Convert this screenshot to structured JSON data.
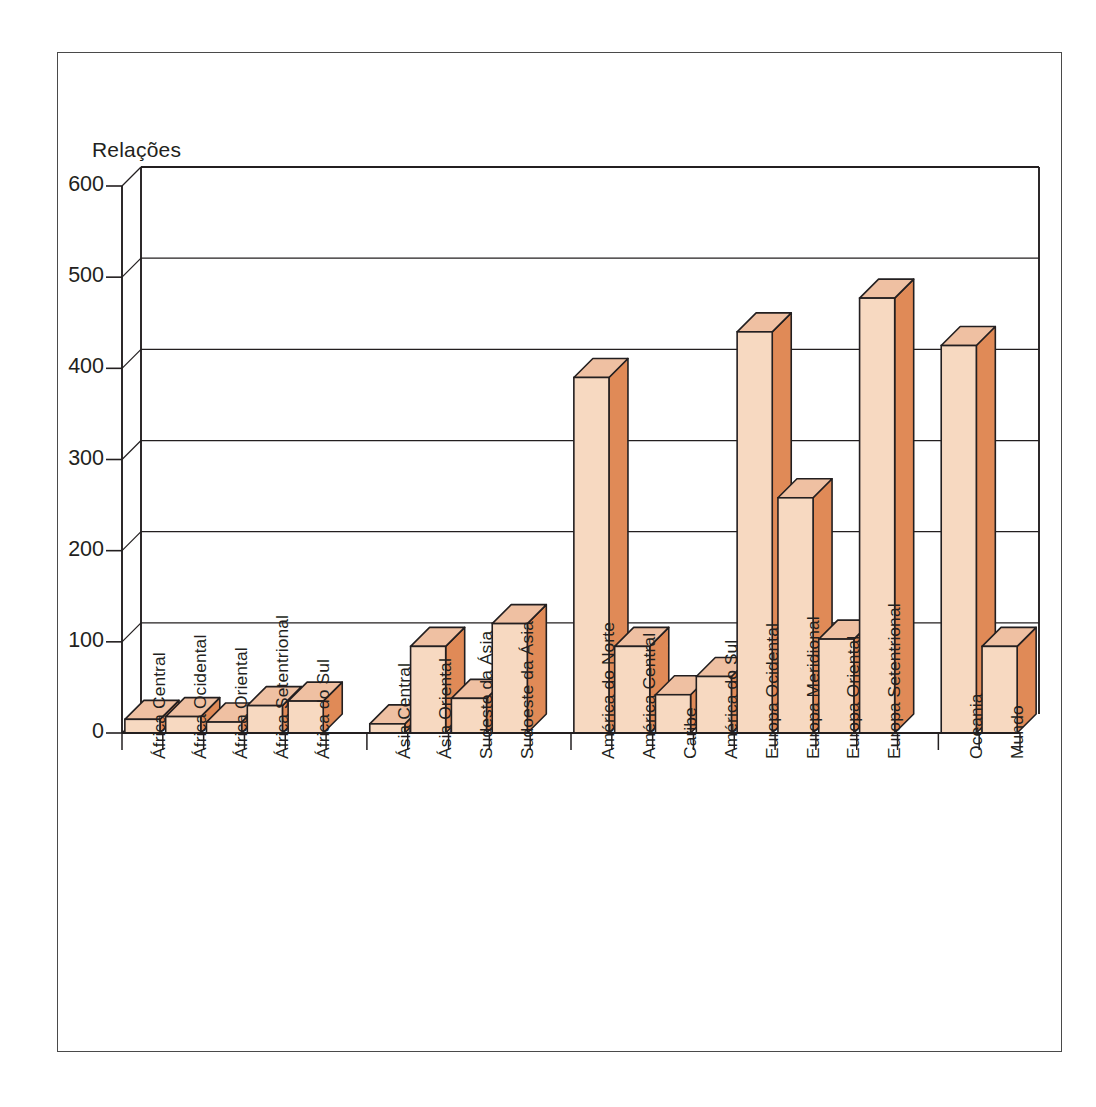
{
  "chart_data": {
    "type": "bar",
    "title": "",
    "subtitle": "",
    "ylabel": "Relações",
    "xlabel": "",
    "ylim": [
      0,
      600
    ],
    "yticks": [
      0,
      100,
      200,
      300,
      400,
      500,
      600
    ],
    "ytick_labels": [
      "0",
      "100",
      "200",
      "300",
      "400",
      "500",
      "600"
    ],
    "grid": true,
    "grid_axis": "y",
    "legend": false,
    "style": "3d-bar",
    "bar_face_color": "#F7D9C1",
    "bar_side_color": "#E08A57",
    "bar_top_color": "#EFC0A2",
    "bar_edge_color": "#231f20",
    "categories": [
      "África Central",
      "África Ocidental",
      "África Oriental",
      "África Setentrional",
      "África do Sul",
      "Ásia Central",
      "Ásia Oriental",
      "Sudeste da Ásia",
      "Sudoeste da Ásia",
      "América do Norte",
      "América Central",
      "Caribe",
      "América do Sul",
      "Europa Ocidental",
      "Europa Meridional",
      "Europa Oriental",
      "Europa Setentrional",
      "Oceania",
      "Mundo"
    ],
    "values": [
      15,
      18,
      12,
      30,
      35,
      10,
      95,
      38,
      120,
      390,
      95,
      42,
      62,
      440,
      258,
      103,
      477,
      425,
      95
    ],
    "group_breaks_after": [
      "África do Sul",
      "Sudoeste da Ásia",
      "América do Sul",
      "Europa Setentrional"
    ],
    "slot_index": [
      0,
      1,
      2,
      3,
      4,
      6,
      7,
      8,
      9,
      11,
      12,
      13,
      14,
      15,
      16,
      17,
      18,
      20,
      21
    ],
    "total_slots": 22
  }
}
